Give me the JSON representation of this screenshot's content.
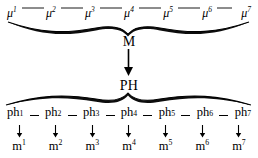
{
  "figure": {
    "top_row": {
      "name": "mu-series",
      "items": [
        {
          "base": "μ",
          "sup": "1"
        },
        {
          "base": "μ",
          "sup": "2"
        },
        {
          "base": "μ",
          "sup": "3"
        },
        {
          "base": "μ",
          "sup": "4"
        },
        {
          "base": "μ",
          "sup": "5"
        },
        {
          "base": "μ",
          "sup": "6"
        },
        {
          "base": "μ",
          "sup": "7"
        }
      ],
      "labels": [
        "μ1",
        "μ2",
        "μ3",
        "μ4",
        "μ5",
        "μ6",
        "μ7"
      ]
    },
    "node_m": "M",
    "node_ph": "PH",
    "middle_row": {
      "name": "ph-series",
      "items": [
        {
          "base": "ph",
          "sup": "1"
        },
        {
          "base": "ph",
          "sup": "2"
        },
        {
          "base": "ph",
          "sup": "3"
        },
        {
          "base": "ph",
          "sup": "4"
        },
        {
          "base": "ph",
          "sup": "5"
        },
        {
          "base": "ph",
          "sup": "6"
        },
        {
          "base": "ph",
          "sup": "7"
        }
      ],
      "labels": [
        "ph1",
        "ph2",
        "ph3",
        "ph4",
        "ph5",
        "ph6",
        "ph7"
      ]
    },
    "bottom_row": {
      "name": "m-series",
      "items": [
        {
          "base": "m",
          "sup": "1"
        },
        {
          "base": "m",
          "sup": "2"
        },
        {
          "base": "m",
          "sup": "3"
        },
        {
          "base": "m",
          "sup": "4"
        },
        {
          "base": "m",
          "sup": "5"
        },
        {
          "base": "m",
          "sup": "6"
        },
        {
          "base": "m",
          "sup": "7"
        }
      ],
      "labels": [
        "m1",
        "m2",
        "m3",
        "m4",
        "m5",
        "m6",
        "m7"
      ]
    },
    "colors": {
      "ink": "#000000",
      "background": "#ffffff"
    }
  }
}
